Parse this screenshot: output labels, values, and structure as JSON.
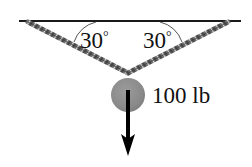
{
  "figure": {
    "background_color": "#ffffff",
    "width": 252,
    "height": 167
  },
  "ceiling": {
    "name": "ceiling-line",
    "color": "#1a1a1a",
    "x1": 20,
    "y1": 21,
    "x2": 240,
    "y2": 21,
    "thickness": 2
  },
  "cables": [
    {
      "name": "left-cable",
      "color": "#4a4a4a",
      "anchor_x": 28,
      "anchor_y": 22,
      "apex_x": 128,
      "apex_y": 73,
      "style": "twisted-rope"
    },
    {
      "name": "right-cable",
      "color": "#4a4a4a",
      "anchor_x": 228,
      "anchor_y": 22,
      "apex_x": 128,
      "apex_y": 73,
      "style": "twisted-rope"
    }
  ],
  "angles": [
    {
      "name": "left-angle",
      "value": "30",
      "degree_symbol": "°",
      "label": "30°",
      "label_x": 80,
      "label_y": 48,
      "arc_color": "#555555"
    },
    {
      "name": "right-angle",
      "value": "30",
      "degree_symbol": "°",
      "label": "30°",
      "label_x": 143,
      "label_y": 48,
      "arc_color": "#555555"
    }
  ],
  "ball": {
    "name": "weight-ball",
    "fill_color": "#8a8a8a",
    "center_x": 128,
    "center_y": 95,
    "radius": 17
  },
  "force_arrow": {
    "name": "weight-force-arrow",
    "color": "#000000",
    "start_x": 128,
    "start_y": 90,
    "end_x": 128,
    "end_y": 156,
    "shaft_width": 4,
    "head_width": 14,
    "head_length": 22
  },
  "weight": {
    "name": "weight-label",
    "magnitude": "100",
    "unit": "lb",
    "label": "100 lb",
    "label_x": 152,
    "label_y": 103
  }
}
